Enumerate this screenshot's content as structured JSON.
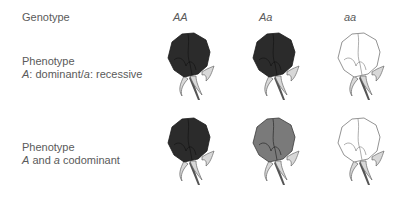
{
  "row_headers": {
    "genotype": "Genotype",
    "phenotype_dominant": {
      "line1": "Phenotype",
      "allele_A": "A",
      "sep1": ": dominant/",
      "allele_a": "a",
      "sep2": ": recessive"
    },
    "phenotype_codominant": {
      "line1": "Phenotype",
      "allele_A": "A",
      "mid": " and ",
      "allele_a": "a",
      "tail": " codominant"
    }
  },
  "genotypes": [
    "AA",
    "Aa",
    "aa"
  ],
  "rows": [
    {
      "name": "dominant-recessive",
      "flowers": [
        {
          "genotype": "AA",
          "fill": "#2b2b2b",
          "stroke": "#1a1a1a"
        },
        {
          "genotype": "Aa",
          "fill": "#2b2b2b",
          "stroke": "#1a1a1a"
        },
        {
          "genotype": "aa",
          "fill": "#ffffff",
          "stroke": "#777777"
        }
      ]
    },
    {
      "name": "codominant",
      "flowers": [
        {
          "genotype": "AA",
          "fill": "#2b2b2b",
          "stroke": "#1a1a1a"
        },
        {
          "genotype": "Aa",
          "fill": "#7a7a7a",
          "stroke": "#3a3a3a"
        },
        {
          "genotype": "aa",
          "fill": "#ffffff",
          "stroke": "#777777"
        }
      ]
    }
  ],
  "colors": {
    "dark": "#2b2b2b",
    "intermediate": "#7a7a7a",
    "white": "#ffffff",
    "sepal": "#d8d8d8",
    "stem": "#555555"
  }
}
